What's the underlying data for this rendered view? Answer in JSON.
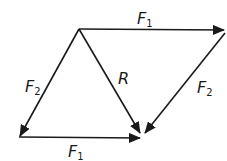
{
  "diagram": {
    "vertices": {
      "top_left": [
        79,
        29
      ],
      "top_right": [
        224,
        30
      ],
      "bottom_left": [
        19,
        137
      ],
      "bottom_right": [
        143,
        137
      ]
    },
    "vectors": [
      {
        "id": "f1-top",
        "from": "top_left",
        "to": "top_right",
        "label": "F",
        "subscript": "1"
      },
      {
        "id": "f2-left",
        "from": "top_left",
        "to": "bottom_left",
        "label": "F",
        "subscript": "2"
      },
      {
        "id": "resultant",
        "from": "top_left",
        "to": "bottom_right",
        "label": "R",
        "subscript": ""
      },
      {
        "id": "f2-right",
        "from": "top_right",
        "to": "bottom_right",
        "label": "F",
        "subscript": "2"
      },
      {
        "id": "f1-bottom",
        "from": "bottom_left",
        "to": "bottom_right",
        "label": "F",
        "subscript": "1"
      }
    ],
    "labels": {
      "f1_top": {
        "main": "F",
        "sub": "1"
      },
      "f2_left": {
        "main": "F",
        "sub": "2"
      },
      "r": {
        "main": "R"
      },
      "f2_right": {
        "main": "F",
        "sub": "2"
      },
      "f1_bottom": {
        "main": "F",
        "sub": "1"
      }
    },
    "colors": {
      "stroke": "#1a1a1a",
      "background": "#ffffff"
    }
  }
}
